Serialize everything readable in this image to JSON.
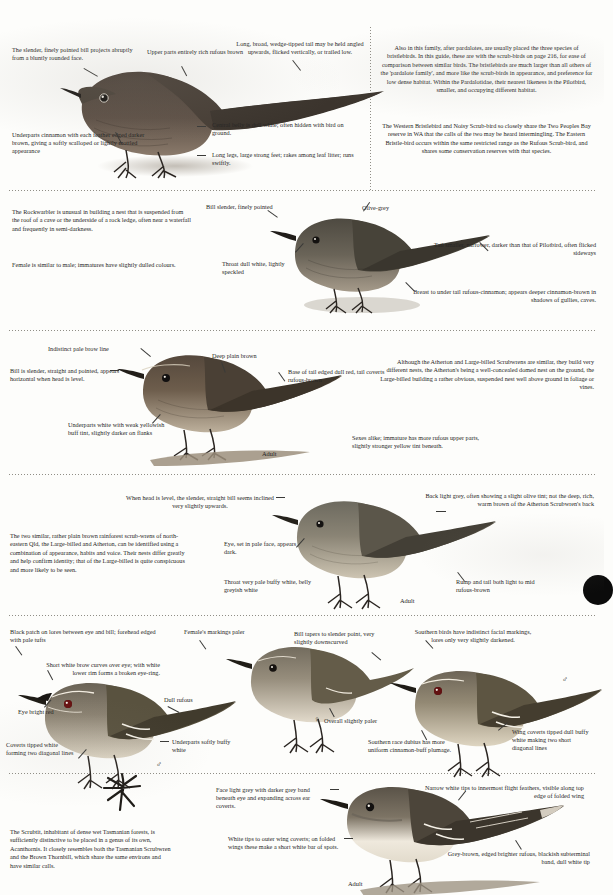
{
  "page": {
    "width": 604,
    "height": 895,
    "background_color": "#fdfdfb",
    "ink_color": "#262524",
    "rule_color": "#8a8880",
    "page_marker_color": "#0b0b0b"
  },
  "sections": [
    {
      "id": "rufous-scrub-bird",
      "captions": [
        "The slender, finely pointed bill projects abruptly from a bluntly rounded face.",
        "Upper parts entirely rich rufous brown",
        "Long, broad, wedge-tipped tail may be held angled upwards, flicked vertically, or trailed low.",
        "Underparts cinnamon with each feather edged darker brown, giving a softly scalloped or lightly mottled appearance",
        "Central belly is dull white; often hidden with bird on ground.",
        "Long legs, large strong feet; rakes among leaf litter; runs swiftly."
      ],
      "notes": [
        "Also in this family, after pardalotes, are usually placed the three species of bristlebirds.  In this guide, these are with the scrub-birds on page 216, for ease of comparison between similar birds.  The bristlebirds are much larger than all others of the 'pardalote family', and more like the scrub-birds in appearance, and preference for low dense habitat.  Within the Pardalotidae, their nearest likeness is the Pilotbird, smaller, and occupying different habitat.",
        "The Western Bristlebird and Noisy Scrub-bird so closely share the Two Peoples Bay reserve in WA that the calls of the two may be heard intermingling.  The Eastern Bristle-bird occurs within the same restricted range as the Rufous Scrub-bird, and shares some conservation reserves with that species."
      ]
    },
    {
      "id": "rockwarbler",
      "captions": [
        "Bill slender, finely pointed",
        "Olive-grey",
        "Throat dull white, lightly speckled",
        "Tail smaller, narrower, darker than that of Pilotbird, often flicked sideways",
        "Breast to under tail rufous-cinnamon; appears deeper cinnamon-brown in shadows of gullies, caves."
      ],
      "notes": [
        "The Rockwarbler is unusual in building a nest that is suspended from the roof of a cave or the underside of a rock ledge, often near a waterfall and frequently in semi-darkness.",
        "Female is similar to male; immatures have slightly dulled colours."
      ]
    },
    {
      "id": "atherton-scrubwren",
      "captions": [
        "Indistinct pale brow line",
        "Deep plain brown",
        "Bill is slender, straight and pointed, appears horizontal when head is level.",
        "Base of tail edged dull red, tail coverts rufous-brown",
        "Underparts white with weak yellowish buff tint, slightly darker on flanks",
        "Adult"
      ],
      "notes": [
        "Although the Atherton and Large-billed Scrubwrens are similar, they build very different nests, the Atherton's being a well-concealed domed nest on the ground, the Large-billed building a rather obvious, suspended nest well above ground in foliage or vines.",
        "Sexes alike; immature has more rufous upper parts, slightly stronger yellow tint beneath."
      ]
    },
    {
      "id": "large-billed-scrubwren",
      "captions": [
        "When head is level, the slender, straight bill seems inclined very slightly upwards.",
        "Back light grey, often showing a slight olive tint; not the deep, rich, warm brown of the Atherton Scrubwren's back",
        "Eye, set in pale face, appears dark.",
        "Throat very pale buffy white, belly greyish white",
        "Rump and tail both light to mid rufous-brown",
        "Adult"
      ],
      "notes": [
        "The two similar, rather plain brown rainforest scrub-wrens of north-eastern Qld, the Large-billed and Atherton, can be identified using a combination of appearance, habits and voice.  Their nests differ greatly and help confirm identity; that of the Large-billed is quite conspicuous and more likely to be seen."
      ]
    },
    {
      "id": "redthroat-group",
      "captions": [
        "Black patch on lores between eye and bill; forehead edged with pale tufts",
        "Female's markings paler",
        "Bill tapers to slender point, very slightly downscurved",
        "Southern birds have indistinct facial markings, lores only very slightly darkened.",
        "Short white brow curves over eye; with white lower rim forms a broken eye-ring.",
        "Dull rufous",
        "Eye bright red",
        "Coverts tipped white forming two diagonal lines",
        "Underparts softly buffy white",
        "Overall slightly paler",
        "Southern race dubius has more uniform cinnamon-buff plumage.",
        "Wing coverts tipped dull buffy white making two short diagonal lines"
      ],
      "symbols": {
        "male": "♂",
        "female": "♀"
      }
    },
    {
      "id": "scrubtit",
      "captions": [
        "Face light grey with darker grey band beneath eye and expanding across ear coverts.",
        "Narrow white tips to innermost flight feathers, visible along top edge of folded wing",
        "White tips to outer wing coverts; on folded wings these make a short white bar of spots.",
        "Grey-brown, edged brighter rufous, blackish subterminal band, dull white tip",
        "Adult"
      ],
      "notes": [
        "The Scrubtit, inhabitant of dense wet Tasmanian forests, is sufficiently distinctive to be placed in a genus of its own, Acanthornis.  It closely resembles both the Tasmanian Scrubwren and the Brown Thornbill, which share the same environs and have similar calls."
      ]
    }
  ]
}
